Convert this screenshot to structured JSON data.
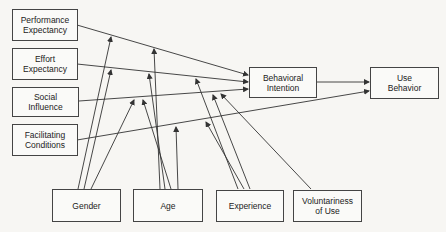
{
  "diagram": {
    "title": "",
    "constructs": [
      {
        "id": "pe",
        "label": "Performance\nExpectancy"
      },
      {
        "id": "ee",
        "label": "Effort\nExpectancy"
      },
      {
        "id": "si",
        "label": "Social\nInfluence"
      },
      {
        "id": "fc",
        "label": "Facilitating\nConditions"
      },
      {
        "id": "bi",
        "label": "Behavioral\nIntention"
      },
      {
        "id": "ub",
        "label": "Use\nBehavior"
      }
    ],
    "moderators": [
      {
        "id": "gender",
        "label": "Gender"
      },
      {
        "id": "age",
        "label": "Age"
      },
      {
        "id": "experience",
        "label": "Experience"
      },
      {
        "id": "voluntariness",
        "label": "Voluntariness\nof Use"
      }
    ],
    "edges": [
      {
        "from": "pe",
        "to": "bi"
      },
      {
        "from": "ee",
        "to": "bi"
      },
      {
        "from": "si",
        "to": "bi"
      },
      {
        "from": "fc",
        "to": "ub"
      },
      {
        "from": "bi",
        "to": "ub"
      }
    ],
    "moderations": [
      {
        "moderator": "gender",
        "edge": "pe->bi"
      },
      {
        "moderator": "gender",
        "edge": "ee->bi"
      },
      {
        "moderator": "gender",
        "edge": "si->bi"
      },
      {
        "moderator": "age",
        "edge": "pe->bi"
      },
      {
        "moderator": "age",
        "edge": "ee->bi"
      },
      {
        "moderator": "age",
        "edge": "si->bi"
      },
      {
        "moderator": "age",
        "edge": "fc->ub"
      },
      {
        "moderator": "experience",
        "edge": "ee->bi"
      },
      {
        "moderator": "experience",
        "edge": "si->bi"
      },
      {
        "moderator": "experience",
        "edge": "fc->ub"
      },
      {
        "moderator": "voluntariness",
        "edge": "si->bi"
      }
    ],
    "colors": {
      "line": "#333333",
      "border": "#444444",
      "background": "#f7f6f3"
    }
  }
}
